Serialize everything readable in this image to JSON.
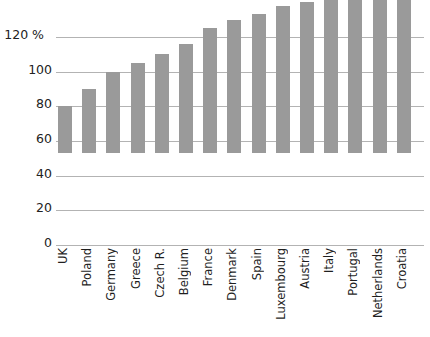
{
  "chart_data": {
    "type": "bar",
    "title": "",
    "subtitle": "",
    "xlabel": "",
    "ylabel": "",
    "unit": "%",
    "unit_label": "120 %",
    "ylim": [
      0,
      140
    ],
    "yticks": [
      0,
      20,
      40,
      60,
      80,
      100,
      120
    ],
    "ytick_labels": [
      "0",
      "20",
      "40",
      "60",
      "80",
      "100",
      "120 %"
    ],
    "grid": true,
    "grid_axis": "y",
    "legend": "none",
    "bar_color": "#9a9a9a",
    "grid_color": "#b3b3b3",
    "background": "#ffffff",
    "categories": [
      "UK",
      "Poland",
      "Germany",
      "Greece",
      "Czech R.",
      "Belgium",
      "France",
      "Denmark",
      "Spain",
      "Luxembourg",
      "Austria",
      "Italy",
      "Portugal",
      "Netherlands",
      "Croatia"
    ],
    "values": [
      27,
      37,
      47,
      52,
      57,
      63,
      72,
      77,
      80,
      85,
      87,
      91,
      94,
      98,
      132
    ]
  }
}
